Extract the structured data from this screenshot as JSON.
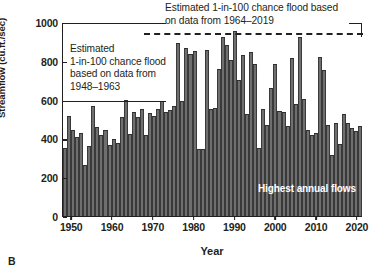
{
  "panel": {
    "letter": "B"
  },
  "axes": {
    "ylabel": "Streamflow (cu.ft./sec)",
    "xlabel": "Year",
    "yticks": [
      "0",
      "200",
      "400",
      "600",
      "800",
      "1000"
    ],
    "xticks": [
      "1950",
      "1960",
      "1970",
      "1980",
      "1990",
      "2000",
      "2010",
      "2020"
    ]
  },
  "annotations": {
    "left_note": "Estimated\n1-in-100 chance flood\nbased on data from\n1948–1963",
    "left_note_lines": [
      "Estimated",
      "1-in-100 chance flood",
      "based on data from",
      "1948–1963"
    ],
    "top_note_lines": [
      "Estimated 1-in-100 chance flood based",
      "on data from 1964–2019"
    ],
    "series_label": "Highest annual flows"
  },
  "colors": {
    "bar_fill": "#6f6f6f",
    "bar_edge": "#3a3a3a",
    "axis": "#231f20",
    "reference_line": "#231f20",
    "background": "#ffffff",
    "inplot_text": "#ffffff"
  },
  "chart_data": {
    "type": "bar",
    "title": "",
    "xlabel": "Year",
    "ylabel": "Streamflow (cu.ft./sec)",
    "ylim": [
      0,
      1000
    ],
    "xlim": [
      1948,
      2021
    ],
    "grid": false,
    "legend": null,
    "series_name": "Highest annual flows",
    "units": "cu.ft./sec",
    "categories": [
      1948,
      1949,
      1950,
      1951,
      1952,
      1953,
      1954,
      1955,
      1956,
      1957,
      1958,
      1959,
      1960,
      1961,
      1962,
      1963,
      1964,
      1965,
      1966,
      1967,
      1968,
      1969,
      1970,
      1971,
      1972,
      1973,
      1974,
      1975,
      1976,
      1977,
      1978,
      1979,
      1980,
      1981,
      1982,
      1983,
      1984,
      1985,
      1986,
      1987,
      1988,
      1989,
      1990,
      1991,
      1992,
      1993,
      1994,
      1995,
      1996,
      1997,
      1998,
      1999,
      2000,
      2001,
      2002,
      2003,
      2004,
      2005,
      2006,
      2007,
      2008,
      2009,
      2010,
      2011,
      2012,
      2013,
      2014,
      2015,
      2016,
      2017,
      2018,
      2019,
      2020,
      2021
    ],
    "values": [
      355,
      520,
      445,
      410,
      430,
      262,
      365,
      570,
      462,
      420,
      445,
      370,
      398,
      380,
      515,
      600,
      425,
      540,
      512,
      555,
      422,
      535,
      520,
      555,
      598,
      540,
      548,
      568,
      895,
      598,
      868,
      838,
      855,
      345,
      345,
      860,
      552,
      560,
      760,
      925,
      888,
      810,
      958,
      705,
      832,
      528,
      852,
      788,
      350,
      552,
      470,
      662,
      790,
      545,
      538,
      468,
      818,
      578,
      930,
      605,
      448,
      422,
      428,
      822,
      755,
      472,
      315,
      482,
      375,
      528,
      480,
      455,
      440,
      465
    ],
    "reference_lines": [
      {
        "name": "Estimated 1-in-100 chance flood based on data from 1948–1963",
        "value": 600,
        "style": "solid",
        "x_start": 1948,
        "x_end": 1964
      },
      {
        "name": "Estimated 1-in-100 chance flood based on data from 1964–2019",
        "value": 950,
        "style": "dashed",
        "x_start": 1968,
        "x_end": 2021
      }
    ]
  }
}
